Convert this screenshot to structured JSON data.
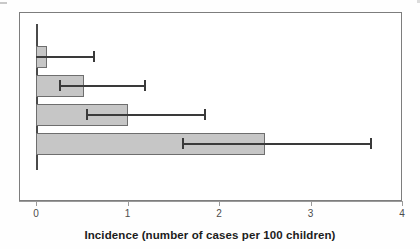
{
  "chart_data": {
    "type": "bar",
    "orientation": "horizontal",
    "title": "",
    "subtitle": "",
    "xlabel": "Incidence (number of cases per 100 children)",
    "ylabel": "",
    "xlim": [
      0,
      4
    ],
    "xticks": [
      0,
      1,
      2,
      3,
      4
    ],
    "xticklabels": [
      "0",
      "1",
      "2",
      "3",
      "4"
    ],
    "yticklabels": [
      "",
      "",
      "",
      ""
    ],
    "grid": false,
    "legend": null,
    "categories": [
      "group-1",
      "group-2",
      "group-3",
      "group-4"
    ],
    "values": [
      0.12,
      0.53,
      1.0,
      2.5
    ],
    "error_low": [
      0.0,
      0.25,
      0.55,
      1.6
    ],
    "error_high": [
      0.62,
      1.18,
      1.84,
      3.65
    ],
    "bars": [
      {
        "index": 0,
        "value": 0.12,
        "ci_low": 0.0,
        "ci_high": 0.62
      },
      {
        "index": 1,
        "value": 0.53,
        "ci_low": 0.25,
        "ci_high": 1.18
      },
      {
        "index": 2,
        "value": 1.0,
        "ci_low": 0.55,
        "ci_high": 1.84
      },
      {
        "index": 3,
        "value": 2.5,
        "ci_low": 1.6,
        "ci_high": 3.65
      }
    ],
    "colors": {
      "bar_fill": "#c6c6c6",
      "bar_stroke": "#6e6e6e",
      "error_bar": "#3a3a3a",
      "axis": "#9a9a9a",
      "frame": "#7d7d7d",
      "text": "#1c1c1c",
      "background": "#ffffff"
    }
  }
}
